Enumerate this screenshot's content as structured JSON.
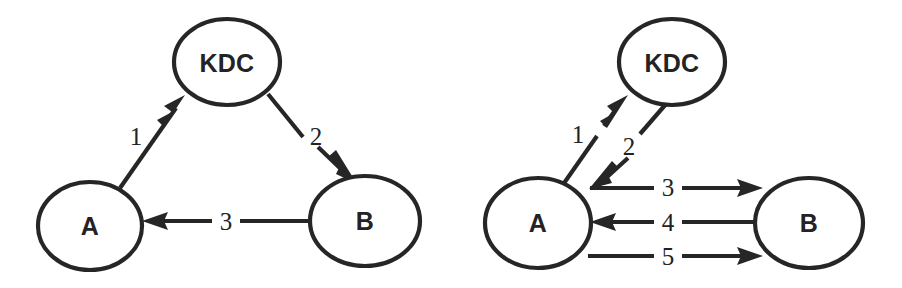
{
  "figure": {
    "title": "",
    "background_color": "#ffffff",
    "stroke_color": "#262626",
    "text_color": "#232323",
    "width": 902,
    "height": 288
  },
  "diagrams": [
    {
      "id": "left",
      "name": "three-message-kdc-protocol",
      "nodes": [
        {
          "id": "kdc",
          "label": "KDC",
          "cx": 227,
          "cy": 62,
          "rx": 53,
          "ry": 43
        },
        {
          "id": "a",
          "label": "A",
          "cx": 90,
          "cy": 226,
          "rx": 52,
          "ry": 44
        },
        {
          "id": "b",
          "label": "B",
          "cx": 365,
          "cy": 221,
          "rx": 55,
          "ry": 45
        }
      ],
      "edges": [
        {
          "id": "e1",
          "label": "1",
          "from": "a",
          "to": "kdc",
          "direction": "A to KDC",
          "label_x": 136,
          "label_y": 136
        },
        {
          "id": "e2",
          "label": "2",
          "from": "kdc",
          "to": "b",
          "direction": "KDC to B",
          "label_x": 316,
          "label_y": 136
        },
        {
          "id": "e3",
          "label": "3",
          "from": "b",
          "to": "a",
          "direction": "B to A",
          "label_x": 226,
          "label_y": 221
        }
      ]
    },
    {
      "id": "right",
      "name": "five-message-kdc-protocol",
      "nodes": [
        {
          "id": "kdc",
          "label": "KDC",
          "cx": 672,
          "cy": 62,
          "rx": 53,
          "ry": 43
        },
        {
          "id": "a",
          "label": "A",
          "cx": 538,
          "cy": 223,
          "rx": 53,
          "ry": 45
        },
        {
          "id": "b",
          "label": "B",
          "cx": 809,
          "cy": 223,
          "rx": 54,
          "ry": 45
        }
      ],
      "edges": [
        {
          "id": "e1",
          "label": "1",
          "from": "a",
          "to": "kdc",
          "direction": "A to KDC",
          "label_x": 578,
          "label_y": 134
        },
        {
          "id": "e2",
          "label": "2",
          "from": "kdc",
          "to": "a",
          "direction": "KDC to A",
          "label_x": 629,
          "label_y": 146
        },
        {
          "id": "e3",
          "label": "3",
          "from": "a",
          "to": "b",
          "direction": "A to B",
          "label_x": 668,
          "label_y": 187
        },
        {
          "id": "e4",
          "label": "4",
          "from": "b",
          "to": "a",
          "direction": "B to A",
          "label_x": 668,
          "label_y": 222
        },
        {
          "id": "e5",
          "label": "5",
          "from": "a",
          "to": "b",
          "direction": "A to B",
          "label_x": 668,
          "label_y": 256
        }
      ]
    }
  ]
}
